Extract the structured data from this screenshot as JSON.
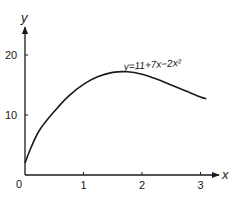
{
  "chart_data": {
    "type": "line",
    "title": "",
    "xlabel": "x",
    "ylabel": "y",
    "xlim": [
      0,
      3.3
    ],
    "ylim": [
      0,
      25
    ],
    "x_ticks": [
      1,
      2,
      3
    ],
    "x_tick_labels": [
      "1",
      "2",
      "3"
    ],
    "y_ticks": [
      10,
      20
    ],
    "y_tick_labels": [
      "10",
      "20"
    ],
    "origin_label": "0",
    "grid": false,
    "annotation": "y=11+7x−2x²",
    "series": [
      {
        "name": "y=11+7x−2x²",
        "x": [
          0,
          0.1,
          0.25,
          0.5,
          0.75,
          1.0,
          1.25,
          1.5,
          1.75,
          2.0,
          2.25,
          2.5,
          2.75,
          3.0,
          3.1
        ],
        "y": [
          2.0,
          4.5,
          7.5,
          10.6,
          13.2,
          15.1,
          16.4,
          17.1,
          17.2,
          16.8,
          16.0,
          15.0,
          14.0,
          13.0,
          12.7
        ]
      }
    ]
  }
}
